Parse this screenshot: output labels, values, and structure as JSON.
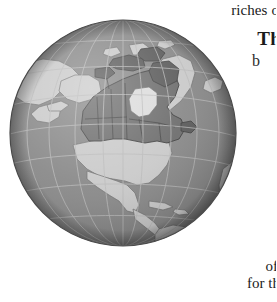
{
  "page": {
    "width": 276,
    "height": 302,
    "background_color": "#ffffff"
  },
  "text_fragments": {
    "body_line_top": "riches o",
    "heading": "Th",
    "subheading": "b",
    "body_line_bottom_1": "of",
    "body_line_bottom_2": "for th"
  },
  "figure": {
    "name": "globe-illustration",
    "projection": "orthographic",
    "center_view": "North America / North Atlantic",
    "highlighted_country": "Canada",
    "colors": {
      "ocean": "#8a8a8a",
      "ocean_shadow": "#6f6f6f",
      "land": "#c9c9c9",
      "land_light": "#dcdcdc",
      "highlight": "#6e6e6e",
      "highlight_dark": "#5a5a5a",
      "graticule": "#b5b5b5",
      "outline": "#4a4a4a",
      "coast_line": "#707070"
    },
    "graticule": {
      "visible": true,
      "meridian_spacing_deg": 15,
      "parallel_spacing_deg": 15
    },
    "labels": {
      "landmasses": [
        "Canada",
        "United States",
        "Mexico",
        "Greenland",
        "Alaska",
        "South America",
        "Siberia",
        "Europe",
        "Africa"
      ]
    }
  }
}
